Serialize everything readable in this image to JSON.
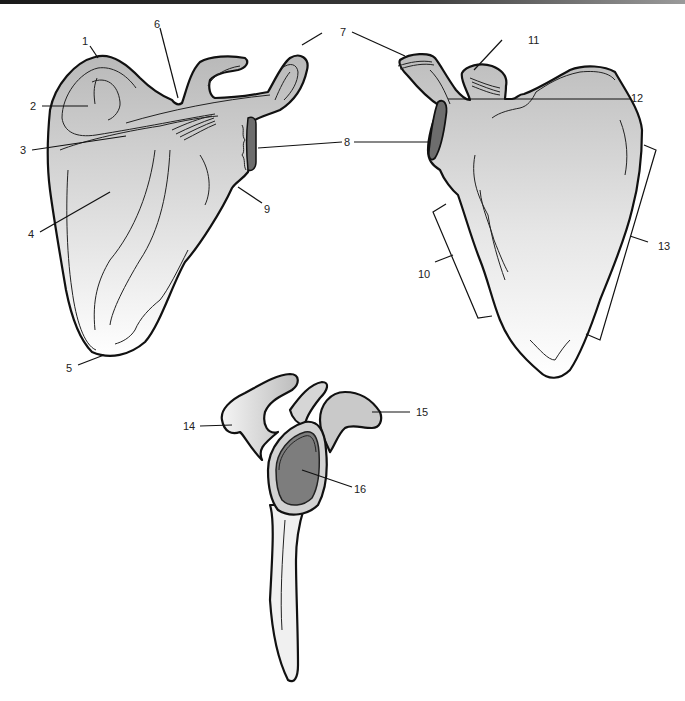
{
  "figure": {
    "colors": {
      "bone_fill_top": "#b8b8b8",
      "bone_fill_bottom": "#ffffff",
      "glenoid_fill": "#7a7a7a",
      "outline": "#111111",
      "top_bar": "#1a1a1a"
    }
  },
  "labels": {
    "l1": "1",
    "l2": "2",
    "l3": "3",
    "l4": "4",
    "l5": "5",
    "l6": "6",
    "l7": "7",
    "l8": "8",
    "l9": "9",
    "l10": "10",
    "l11": "11",
    "l12": "12",
    "l13": "13",
    "l14": "14",
    "l15": "15",
    "l16": "16"
  },
  "views": [
    {
      "name": "posterior",
      "labels": [
        "1",
        "2",
        "3",
        "4",
        "5",
        "6",
        "7",
        "8",
        "9"
      ]
    },
    {
      "name": "anterior",
      "labels": [
        "7",
        "8",
        "10",
        "11",
        "12",
        "13"
      ]
    },
    {
      "name": "lateral",
      "labels": [
        "14",
        "15",
        "16"
      ]
    }
  ]
}
